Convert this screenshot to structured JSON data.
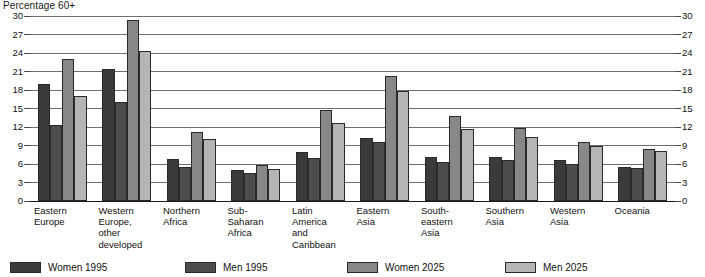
{
  "chart_data": {
    "type": "bar",
    "title": "Percentage 60+",
    "xlabel": "",
    "ylabel": "Percentage 60+",
    "ylim": [
      0,
      30
    ],
    "yticks": [
      0,
      3,
      6,
      9,
      12,
      15,
      18,
      21,
      24,
      27,
      30
    ],
    "grid": true,
    "legend_position": "bottom",
    "dual_y_axis": true,
    "categories": [
      "Eastern Europe",
      "Western Europe, other developed",
      "Northern Africa",
      "Sub-Saharan Africa",
      "Latin America and Caribbean",
      "Eastern Asia",
      "South-eastern Asia",
      "Southern Asia",
      "Western Asia",
      "Oceania"
    ],
    "category_label_lines": [
      [
        "Eastern",
        "Europe"
      ],
      [
        "Western",
        "Europe,",
        "other",
        "developed"
      ],
      [
        "Northern",
        "Africa"
      ],
      [
        "Sub-",
        "Saharan",
        "Africa"
      ],
      [
        "Latin",
        "America",
        "and",
        "Caribbean"
      ],
      [
        "Eastern",
        "Asia"
      ],
      [
        "South-",
        "eastern",
        "Asia"
      ],
      [
        "Southern",
        "Asia"
      ],
      [
        "Western",
        "Asia"
      ],
      [
        "Oceania"
      ]
    ],
    "series": [
      {
        "name": "Women 1995",
        "color": "#3a3a3a",
        "values": [
          19.0,
          21.4,
          6.8,
          5.1,
          8.0,
          10.2,
          7.1,
          7.2,
          6.6,
          5.5
        ]
      },
      {
        "name": "Men 1995",
        "color": "#4d4d4d",
        "values": [
          12.3,
          16.1,
          5.5,
          4.5,
          7.0,
          9.6,
          6.3,
          6.6,
          6.0,
          5.4
        ]
      },
      {
        "name": "Women 2025",
        "color": "#888888",
        "values": [
          23.0,
          29.4,
          11.2,
          5.9,
          14.8,
          20.2,
          13.8,
          11.8,
          9.5,
          8.4
        ]
      },
      {
        "name": "Men 2025",
        "color": "#b5b5b5",
        "values": [
          17.1,
          24.4,
          10.1,
          5.2,
          12.6,
          17.8,
          11.7,
          10.4,
          9.0,
          8.1
        ]
      }
    ]
  }
}
